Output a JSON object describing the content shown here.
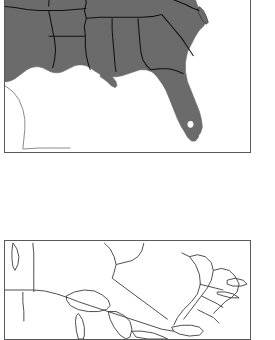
{
  "figure": {
    "type": "map-figure-pair",
    "background_color": "#ffffff",
    "panel_border_color": "#58595b",
    "panel_border_width_px": 1,
    "panels": [
      {
        "id": "panel-a",
        "name": "shaded-study-area-map",
        "label": "",
        "style": "choropleth-filled",
        "fill_color": "#6b6b6b",
        "outline_color": "#111111",
        "water_color": "#ffffff",
        "region": "Southeastern United States",
        "cropped_edge": "top",
        "frame": {
          "x": 4,
          "y": -48,
          "width": 247,
          "height": 201
        },
        "shaded_features": [
          "Texas (eastern)",
          "Oklahoma",
          "Arkansas",
          "Louisiana",
          "Mississippi",
          "Alabama",
          "Georgia",
          "Florida",
          "South Carolina",
          "North Carolina",
          "Tennessee",
          "Kentucky",
          "Virginia",
          "Missouri (southern)"
        ],
        "unshaded_features": [
          "Gulf of Mexico",
          "Atlantic Ocean"
        ]
      },
      {
        "id": "panel-b",
        "name": "outline-reference-map",
        "label": "",
        "style": "outline-only",
        "fill_color": "#ffffff",
        "outline_color": "#3a3a3a",
        "region": "Northern United States and Great Lakes",
        "cropped_edge": "bottom",
        "frame": {
          "x": 4,
          "y": 240,
          "width": 247,
          "height": 100
        },
        "shaded_features": [],
        "unshaded_features": [
          "Great Lakes",
          "Lake Superior",
          "Lake Michigan",
          "Lake Huron",
          "Lake Erie",
          "Lake Ontario"
        ]
      }
    ],
    "gap_between_panels_px": 87
  },
  "chart_data": {
    "type": "map",
    "title": "",
    "xlabel": "",
    "ylabel": "",
    "grid": false,
    "legend": "none",
    "panel_count": 2,
    "panels": [
      {
        "name": "panel-a",
        "encoding": "binary-fill",
        "categories": [
          "shaded (in study region)",
          "unshaded (outside / water)"
        ],
        "values": [
          1,
          0
        ],
        "colors": [
          "#6b6b6b",
          "#ffffff"
        ]
      },
      {
        "name": "panel-b",
        "encoding": "outline",
        "categories": [
          "boundary"
        ],
        "values": [
          1
        ],
        "colors": [
          "#3a3a3a"
        ]
      }
    ]
  }
}
